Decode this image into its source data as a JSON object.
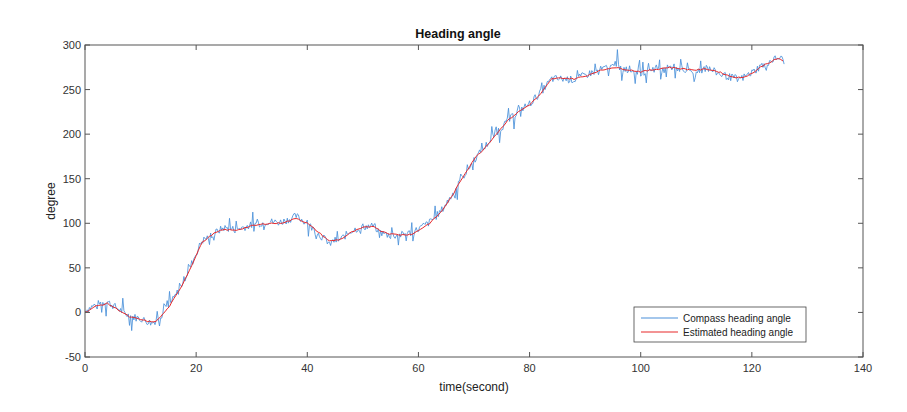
{
  "chart_data": {
    "type": "line",
    "title": "Heading angle",
    "xlabel": "time(second)",
    "ylabel": "degree",
    "xlim": [
      0,
      140
    ],
    "ylim": [
      -50,
      300
    ],
    "xticks": [
      0,
      20,
      40,
      60,
      80,
      100,
      120,
      140
    ],
    "yticks": [
      -50,
      0,
      50,
      100,
      150,
      200,
      250,
      300
    ],
    "grid": false,
    "legend_position": "lower right",
    "series": [
      {
        "name": "Compass heading angle",
        "color": "#4a90d9",
        "noise_amplitude": 6,
        "x": [
          0,
          2,
          4,
          6,
          8,
          10,
          12,
          13,
          15,
          17,
          19,
          21,
          23,
          25,
          27,
          30,
          33,
          35,
          37,
          38,
          40,
          42,
          44,
          46,
          48,
          50,
          52,
          53,
          55,
          57,
          59,
          62,
          64,
          66,
          68,
          70,
          72,
          74,
          76,
          78,
          80,
          82,
          84,
          86,
          88,
          90,
          92,
          95,
          98,
          100,
          102,
          105,
          108,
          110,
          112,
          114,
          116,
          118,
          120,
          122,
          124,
          125,
          126
        ],
        "values": [
          2,
          9,
          12,
          4,
          -4,
          -7,
          -12,
          -8,
          6,
          26,
          52,
          80,
          88,
          95,
          93,
          98,
          102,
          101,
          105,
          108,
          100,
          88,
          78,
          82,
          92,
          96,
          97,
          90,
          86,
          87,
          90,
          101,
          113,
          131,
          152,
          171,
          186,
          202,
          214,
          226,
          234,
          247,
          262,
          262,
          261,
          266,
          271,
          276,
          271,
          269,
          273,
          276,
          272,
          271,
          274,
          268,
          264,
          262,
          269,
          278,
          284,
          286,
          281
        ]
      },
      {
        "name": "Estimated heading angle",
        "color": "#e8282b",
        "x": [
          0,
          2,
          4,
          6,
          8,
          10,
          12,
          13,
          15,
          17,
          19,
          21,
          23,
          25,
          27,
          30,
          33,
          35,
          37,
          38,
          40,
          42,
          44,
          46,
          48,
          50,
          52,
          53,
          55,
          57,
          59,
          62,
          64,
          66,
          68,
          70,
          72,
          74,
          76,
          78,
          80,
          82,
          84,
          86,
          88,
          90,
          92,
          95,
          98,
          100,
          102,
          105,
          108,
          110,
          112,
          114,
          116,
          118,
          120,
          122,
          124,
          125,
          126
        ],
        "values": [
          0,
          7,
          10,
          3,
          -5,
          -8,
          -11,
          -9,
          5,
          25,
          50,
          78,
          88,
          93,
          92,
          97,
          100,
          100,
          103,
          106,
          100,
          90,
          80,
          82,
          90,
          95,
          97,
          92,
          88,
          87,
          88,
          100,
          112,
          130,
          152,
          172,
          185,
          200,
          215,
          225,
          233,
          245,
          262,
          263,
          262,
          265,
          270,
          275,
          272,
          270,
          272,
          275,
          273,
          272,
          273,
          270,
          265,
          263,
          268,
          277,
          283,
          285,
          280
        ]
      }
    ]
  }
}
